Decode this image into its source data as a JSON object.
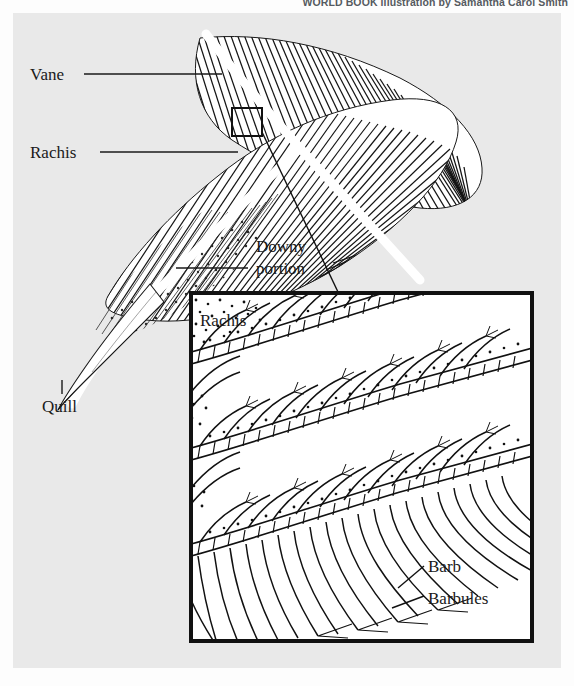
{
  "credit": {
    "text": "WORLD BOOK illustration by Samantha Carol Smith"
  },
  "figure": {
    "background_color": "#e9e9e9",
    "ink_color": "#1a1a1a"
  },
  "main_labels": {
    "vane": "Vane",
    "rachis": "Rachis",
    "downy_line1": "Downy",
    "downy_line2": "portion",
    "quill": "Quill"
  },
  "inset_labels": {
    "rachis": "Rachis",
    "barb": "Barb",
    "barbules": "Barbules"
  }
}
